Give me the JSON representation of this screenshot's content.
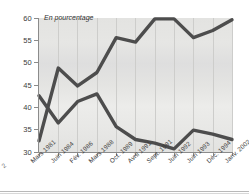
{
  "annotation": "En pourcentage",
  "left_edge_fragment": "2",
  "axes": {
    "y_ticks": [
      "60",
      "55",
      "50",
      "45",
      "40",
      "35",
      "30"
    ],
    "y_values": [
      60,
      55,
      50,
      45,
      40,
      35,
      30
    ],
    "ylim": [
      30,
      60
    ],
    "x_ticks": [
      "Mars 1981",
      "Juin 1984",
      "Fév. 1986",
      "Mars 1988",
      "Oct. 1989",
      "Avril 1991",
      "Sept. 1991",
      "Juin 1992",
      "Juin 1993",
      "Déc. 1994",
      "Janv. 2002"
    ]
  },
  "colors": {
    "line": "#4a4a4a",
    "plot_background": "#e4e4e2",
    "axis": "#8b8b8b",
    "grid": "#cdcdcb",
    "text": "#3b3b3b"
  },
  "chart_data": {
    "type": "line",
    "title": "",
    "subtitle": "",
    "xlabel": "",
    "ylabel": "En pourcentage",
    "ylim": [
      30,
      60
    ],
    "grid": "vertical",
    "legend": "none",
    "categories": [
      "Mars 1981",
      "Juin 1984",
      "Fév. 1986",
      "Mars 1988",
      "Oct. 1989",
      "Avril 1991",
      "Sept. 1991",
      "Juin 1992",
      "Juin 1993",
      "Déc. 1994",
      "Janv. 2002"
    ],
    "series": [
      {
        "name": "Serie croissante",
        "values": [
          32.5,
          48.8,
          44.8,
          47.8,
          55.6,
          54.6,
          59.8,
          59.8,
          55.6,
          57.2,
          59.6
        ]
      },
      {
        "name": "Serie decroissante",
        "values": [
          42.6,
          36.5,
          41.3,
          43.0,
          35.7,
          32.8,
          32.0,
          30.7,
          34.9,
          34.0,
          32.8
        ]
      }
    ]
  }
}
